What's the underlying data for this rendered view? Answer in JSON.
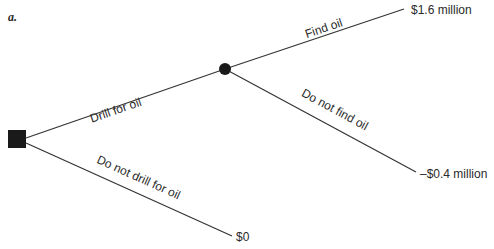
{
  "panel_label": "a.",
  "diagram": {
    "type": "decision-tree",
    "colors": {
      "line": "#333333",
      "node": "#1a1a1a",
      "text": "#2a2a2a",
      "background": "#ffffff"
    },
    "nodes": {
      "decision": {
        "shape": "square",
        "x": 17,
        "y": 139
      },
      "chance": {
        "shape": "circle",
        "x": 225,
        "y": 69
      }
    },
    "branches": {
      "drill": {
        "label": "Drill for oil"
      },
      "no_drill": {
        "label": "Do not drill for oil",
        "outcome": "$0"
      },
      "find": {
        "label": "Find oil",
        "outcome": "$1.6 million"
      },
      "no_find": {
        "label": "Do not find oil",
        "outcome": "–$0.4 million"
      }
    }
  }
}
